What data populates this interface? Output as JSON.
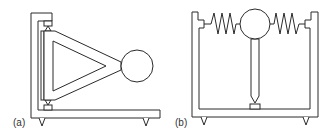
{
  "figure": {
    "panels": [
      {
        "id": "a",
        "label": "(a)",
        "description": "L-shaped frame with pivoted triangular arm carrying a circular mass, supported on two pointed feet"
      },
      {
        "id": "b",
        "label": "(b)",
        "description": "U-shaped frame with circular mass held between two horizontal springs, supported by a vertical rod on a pivot, on two pointed feet"
      }
    ],
    "colors": {
      "line": "#2a2a2a",
      "background": "#ffffff",
      "label": "#333333"
    }
  }
}
